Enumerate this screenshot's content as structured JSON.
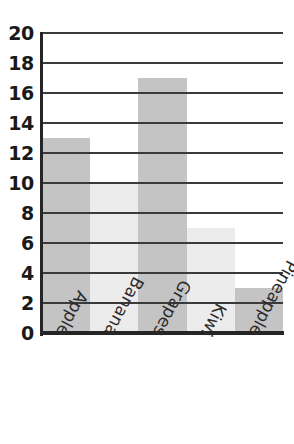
{
  "chart_data": {
    "type": "bar",
    "title": "",
    "subtitle": "",
    "xlabel": "",
    "ylabel": "",
    "categories": [
      "Apple",
      "Banana",
      "Grapes",
      "Kiwi",
      "Pineapple"
    ],
    "values": [
      13,
      10,
      17,
      7,
      3
    ],
    "ylim": [
      0,
      20
    ],
    "xlim": null,
    "yticks": [
      0,
      2,
      4,
      6,
      8,
      10,
      12,
      14,
      16,
      18,
      20
    ],
    "ytick_labels": [
      "0",
      "2",
      "4",
      "6",
      "8",
      "10",
      "12",
      "14",
      "16",
      "18",
      "20"
    ],
    "grid": true,
    "grid_axis": "y",
    "legend": false,
    "legend_position": "none",
    "annotations": [],
    "bar_gap": 0,
    "bar_colors": [
      "#c4c4c4",
      "#ececec",
      "#c4c4c4",
      "#ececec",
      "#c4c4c4"
    ]
  },
  "style": {
    "background": "#ffffff",
    "gridline_color": "#3a3a3a",
    "axis_color": "#252525",
    "ytick_text_color": "#1a1a1a",
    "xlabel_text_color": "#2b2b2b",
    "bar_fill_dark": "#c4c4c4",
    "bar_fill_light": "#ececec"
  }
}
